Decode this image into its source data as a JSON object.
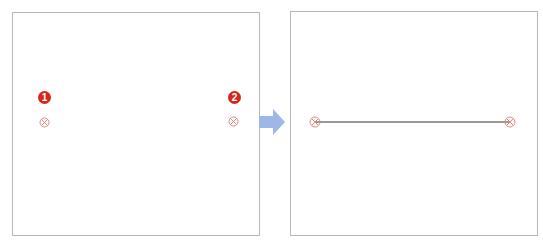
{
  "diagram": {
    "step_before": {
      "points": [
        {
          "label": "1",
          "x": 44,
          "y": 122
        },
        {
          "label": "2",
          "x": 233,
          "y": 122
        }
      ]
    },
    "step_after": {
      "line": {
        "from": [
          315,
          122
        ],
        "to": [
          510,
          122
        ]
      }
    },
    "colors": {
      "badge": "#d8261b",
      "marker": "#e08a80",
      "arrow": "#9fb7e6",
      "line": "#333333",
      "border": "#b8b8b8"
    }
  }
}
